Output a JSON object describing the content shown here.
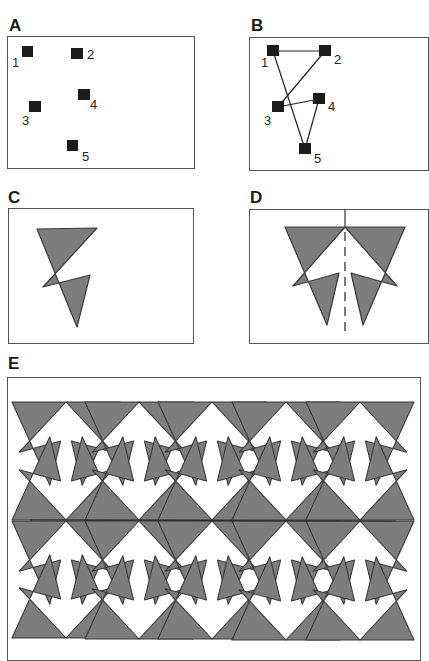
{
  "figure": {
    "panels": [
      {
        "id": "A",
        "label": "A",
        "description": "Five separate points",
        "points": [
          {
            "n": "1"
          },
          {
            "n": "2"
          },
          {
            "n": "3"
          },
          {
            "n": "4"
          },
          {
            "n": "5"
          }
        ]
      },
      {
        "id": "B",
        "label": "B",
        "description": "Points connected into a closed path 1-2-3-4-5-1",
        "points": [
          {
            "n": "1"
          },
          {
            "n": "2"
          },
          {
            "n": "3"
          },
          {
            "n": "4"
          },
          {
            "n": "5"
          }
        ],
        "edges": [
          [
            "1",
            "2"
          ],
          [
            "2",
            "3"
          ],
          [
            "3",
            "4"
          ],
          [
            "4",
            "5"
          ],
          [
            "5",
            "1"
          ]
        ]
      },
      {
        "id": "C",
        "label": "C",
        "description": "Filled self-intersecting polygon motif"
      },
      {
        "id": "D",
        "label": "D",
        "description": "Motif reflected across a vertical dashed mirror axis"
      },
      {
        "id": "E",
        "label": "E",
        "description": "Reflected motif tiled into a 5 x 2 repeating pattern with horizontal mirror",
        "grid": {
          "columns": 5,
          "rows": 2
        }
      }
    ]
  },
  "colors": {
    "fill": "#7d7d7d",
    "stroke": "#3a3a3a",
    "frame": "#555555",
    "marker": "#1c1c1c"
  }
}
